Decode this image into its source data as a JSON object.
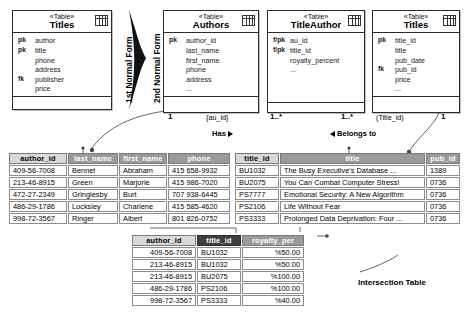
{
  "diagram": {
    "transform_labels": [
      {
        "text": "1st Normal Form"
      },
      {
        "text": "2nd Normal Form"
      }
    ],
    "caption": "Intersection Table"
  },
  "uml_tables": [
    {
      "stereotype": "«Table»",
      "name": "Titles",
      "icon": "table-grid-icon",
      "attributes": [
        {
          "key": "pk",
          "name": "author"
        },
        {
          "key": "pk",
          "name": "title"
        },
        {
          "key": "",
          "name": "phone"
        },
        {
          "key": "",
          "name": "address"
        },
        {
          "key": "fk",
          "name": "publisher"
        },
        {
          "key": "",
          "name": "price"
        }
      ]
    },
    {
      "stereotype": "«Table»",
      "name": "Authors",
      "icon": "table-grid-icon",
      "attributes": [
        {
          "key": "pk",
          "name": "author_id"
        },
        {
          "key": "",
          "name": "last_name"
        },
        {
          "key": "",
          "name": "first_name"
        },
        {
          "key": "",
          "name": "phone"
        },
        {
          "key": "",
          "name": "address"
        },
        {
          "key": "",
          "name": "..."
        }
      ]
    },
    {
      "stereotype": "«Table»",
      "name": "TitleAuthor",
      "icon": "table-grid-icon",
      "attributes": [
        {
          "key": "f/pk",
          "name": "au_id"
        },
        {
          "key": "f/pk",
          "name": "title_id"
        },
        {
          "key": "",
          "name": "royalty_percent"
        },
        {
          "key": "",
          "name": "..."
        }
      ]
    },
    {
      "stereotype": "«Table»",
      "name": "Titles",
      "icon": "table-grid-icon",
      "attributes": [
        {
          "key": "pk",
          "name": "title_id"
        },
        {
          "key": "",
          "name": "title"
        },
        {
          "key": "",
          "name": "pub_date"
        },
        {
          "key": "fk",
          "name": "pub_id"
        },
        {
          "key": "",
          "name": "price"
        },
        {
          "key": "",
          "name": "..."
        }
      ]
    }
  ],
  "associations": {
    "authors_mult": "1",
    "authors_rolekey": "{au_id}",
    "titleauthor_left_mult": "1..*",
    "titleauthor_right_mult": "1..*",
    "titles_rolekey": "(Title_id)",
    "titles_mult": "1",
    "has_label": "Has",
    "belongs_label": "Belongs to"
  },
  "authors_grid": {
    "headers": [
      "author_id",
      "last_name",
      "first_name",
      "phone"
    ],
    "rows": [
      [
        "409-56-7008",
        "Bennet",
        "Abraham",
        "415 658-9932"
      ],
      [
        "213-46-8915",
        "Green",
        "Marjorie",
        "415 986-7020"
      ],
      [
        "472-27-2349",
        "Gringlesby",
        "Burt",
        "707 938-6445"
      ],
      [
        "486-29-1786",
        "Locksley",
        "Charlene",
        "415 585-4620"
      ],
      [
        "998-72-3567",
        "Ringer",
        "Albert",
        "801 826-0752"
      ]
    ]
  },
  "titles_grid": {
    "headers": [
      "title_id",
      "title",
      "pub_id"
    ],
    "rows": [
      [
        "BU1032",
        "The Busy Executive's Database ...",
        "1389"
      ],
      [
        "BU2075",
        "You Can Combat Computer Stress!",
        "0736"
      ],
      [
        "PS7777",
        "Emotional Security: A New Algorithm",
        "0736"
      ],
      [
        "PS2106",
        "Life Without Fear",
        "0736"
      ],
      [
        "PS3333",
        "Prolonged Data Deprivation: Four ...",
        "0736"
      ]
    ]
  },
  "titleauthor_grid": {
    "headers": [
      "author_id",
      "title_id",
      "royalty_per"
    ],
    "rows": [
      [
        "409-56-7008",
        "BU1032",
        "%50.00"
      ],
      [
        "213-46-8915",
        "BU1032",
        "%50.00"
      ],
      [
        "213-46-8915",
        "BU2075",
        "%100.00"
      ],
      [
        "486-29-1786",
        "PS2106",
        "%100.00"
      ],
      [
        "998-72-3567",
        "PS3333",
        "%40.00"
      ]
    ]
  }
}
